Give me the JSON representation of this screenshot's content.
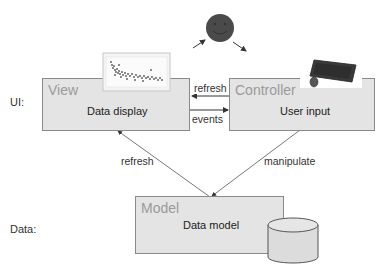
{
  "layers": {
    "ui_label": "UI:",
    "data_label": "Data:"
  },
  "nodes": {
    "view": {
      "title": "View",
      "subtitle": "Data display",
      "icon": "scatter-chart-thumbnail"
    },
    "controller": {
      "title": "Controller",
      "subtitle": "User input",
      "icon": "keyboard-mouse"
    },
    "model": {
      "title": "Model",
      "subtitle": "Data model",
      "icon": "database-cylinder"
    },
    "user": {
      "icon": "smiley-face"
    }
  },
  "edges": {
    "controller_to_view": "refresh",
    "view_to_controller": "events",
    "model_to_view": "refresh",
    "controller_to_model": "manipulate"
  },
  "colors": {
    "box_fill": "#e4e4e4",
    "box_border": "#8a8a8a",
    "title_text": "#9a9a9a",
    "arrow": "#333333",
    "smiley": "#4a4a4a"
  }
}
